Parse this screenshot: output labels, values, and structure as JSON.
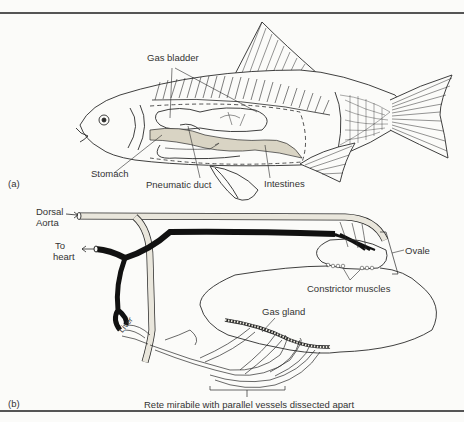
{
  "figure": {
    "panels": [
      {
        "id": "a",
        "tag": "(a)",
        "labels": {
          "gas_bladder": "Gas bladder",
          "stomach": "Stomach",
          "pneumatic_duct": "Pneumatic duct",
          "intestines": "Intestines"
        }
      },
      {
        "id": "b",
        "tag": "(b)",
        "labels": {
          "dorsal_aorta_1": "Dorsal",
          "dorsal_aorta_2": "Aorta",
          "to_heart_1": "To",
          "to_heart_2": "heart",
          "ovale": "Ovale",
          "constrictor_muscles": "Constrictor muscles",
          "gas_gland": "Gas gland",
          "liver": "Liver",
          "rete_mirabile": "Rete mirabile with parallel vessels dissected apart"
        }
      }
    ],
    "colors": {
      "line": "#2a2a2a",
      "vein": "#111111",
      "artery_fill": "#e9e6dc",
      "background": "#fbfbf9"
    }
  }
}
